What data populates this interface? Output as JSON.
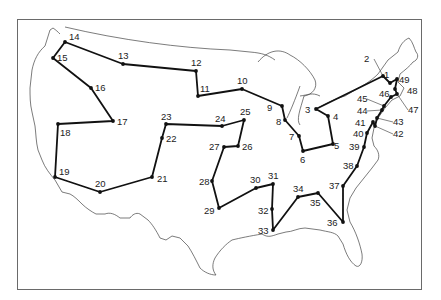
{
  "map": {
    "title": "Traveling salesman tour of 49 US cities",
    "frame": {
      "x": 17,
      "y": 19,
      "width": 404,
      "height": 270
    },
    "route_color": "#111111",
    "outline_color": "#444444",
    "stops": [
      {
        "n": "1",
        "x": 390,
        "y": 83,
        "lx": 384,
        "ly": 78
      },
      {
        "n": "2",
        "x": 383,
        "y": 76,
        "lx": 364,
        "ly": 62,
        "leader": true
      },
      {
        "n": "3",
        "x": 316,
        "y": 109,
        "lx": 305,
        "ly": 113
      },
      {
        "n": "4",
        "x": 328,
        "y": 116,
        "lx": 333,
        "ly": 120
      },
      {
        "n": "5",
        "x": 333,
        "y": 144,
        "lx": 334,
        "ly": 149
      },
      {
        "n": "6",
        "x": 303,
        "y": 151,
        "lx": 300,
        "ly": 163
      },
      {
        "n": "7",
        "x": 299,
        "y": 136,
        "lx": 289,
        "ly": 140
      },
      {
        "n": "8",
        "x": 285,
        "y": 120,
        "lx": 276,
        "ly": 125
      },
      {
        "n": "9",
        "x": 282,
        "y": 106,
        "lx": 267,
        "ly": 111
      },
      {
        "n": "10",
        "x": 242,
        "y": 89,
        "lx": 237,
        "ly": 84
      },
      {
        "n": "11",
        "x": 198,
        "y": 96,
        "lx": 200,
        "ly": 92
      },
      {
        "n": "12",
        "x": 196,
        "y": 71,
        "lx": 191,
        "ly": 66
      },
      {
        "n": "13",
        "x": 123,
        "y": 64,
        "lx": 118,
        "ly": 59
      },
      {
        "n": "14",
        "x": 65,
        "y": 42,
        "lx": 69,
        "ly": 40
      },
      {
        "n": "15",
        "x": 53,
        "y": 58,
        "lx": 57,
        "ly": 61
      },
      {
        "n": "16",
        "x": 91,
        "y": 88,
        "lx": 95,
        "ly": 91
      },
      {
        "n": "17",
        "x": 113,
        "y": 121,
        "lx": 117,
        "ly": 125
      },
      {
        "n": "18",
        "x": 58,
        "y": 124,
        "lx": 60,
        "ly": 136
      },
      {
        "n": "19",
        "x": 55,
        "y": 177,
        "lx": 59,
        "ly": 175
      },
      {
        "n": "20",
        "x": 100,
        "y": 192,
        "lx": 95,
        "ly": 187
      },
      {
        "n": "21",
        "x": 152,
        "y": 177,
        "lx": 157,
        "ly": 182
      },
      {
        "n": "22",
        "x": 162,
        "y": 138,
        "lx": 166,
        "ly": 142
      },
      {
        "n": "23",
        "x": 166,
        "y": 124,
        "lx": 161,
        "ly": 120
      },
      {
        "n": "24",
        "x": 222,
        "y": 126,
        "lx": 215,
        "ly": 122
      },
      {
        "n": "25",
        "x": 244,
        "y": 120,
        "lx": 240,
        "ly": 115
      },
      {
        "n": "26",
        "x": 238,
        "y": 146,
        "lx": 242,
        "ly": 150
      },
      {
        "n": "27",
        "x": 224,
        "y": 147,
        "lx": 209,
        "ly": 150
      },
      {
        "n": "28",
        "x": 212,
        "y": 181,
        "lx": 199,
        "ly": 185
      },
      {
        "n": "29",
        "x": 219,
        "y": 208,
        "lx": 204,
        "ly": 214
      },
      {
        "n": "30",
        "x": 256,
        "y": 188,
        "lx": 250,
        "ly": 183
      },
      {
        "n": "31",
        "x": 273,
        "y": 184,
        "lx": 268,
        "ly": 179
      },
      {
        "n": "32",
        "x": 272,
        "y": 209,
        "lx": 258,
        "ly": 214
      },
      {
        "n": "33",
        "x": 273,
        "y": 230,
        "lx": 258,
        "ly": 234
      },
      {
        "n": "34",
        "x": 298,
        "y": 197,
        "lx": 293,
        "ly": 192
      },
      {
        "n": "35",
        "x": 318,
        "y": 193,
        "lx": 310,
        "ly": 206
      },
      {
        "n": "36",
        "x": 343,
        "y": 222,
        "lx": 327,
        "ly": 226
      },
      {
        "n": "37",
        "x": 343,
        "y": 186,
        "lx": 329,
        "ly": 189
      },
      {
        "n": "38",
        "x": 357,
        "y": 166,
        "lx": 343,
        "ly": 169
      },
      {
        "n": "39",
        "x": 364,
        "y": 147,
        "lx": 349,
        "ly": 150
      },
      {
        "n": "40",
        "x": 367,
        "y": 133,
        "lx": 353,
        "ly": 137
      },
      {
        "n": "41",
        "x": 373,
        "y": 122,
        "lx": 355,
        "ly": 126
      },
      {
        "n": "42",
        "x": 375,
        "y": 126,
        "lx": 393,
        "ly": 137,
        "leader": true
      },
      {
        "n": "43",
        "x": 377,
        "y": 118,
        "lx": 393,
        "ly": 125,
        "leader": true
      },
      {
        "n": "44",
        "x": 382,
        "y": 110,
        "lx": 357,
        "ly": 114,
        "leader": true
      },
      {
        "n": "45",
        "x": 384,
        "y": 106,
        "lx": 357,
        "ly": 102,
        "leader": true
      },
      {
        "n": "46",
        "x": 391,
        "y": 97,
        "lx": 379,
        "ly": 97
      },
      {
        "n": "47",
        "x": 397,
        "y": 94,
        "lx": 408,
        "ly": 113,
        "leader": true
      },
      {
        "n": "48",
        "x": 395,
        "y": 89,
        "lx": 407,
        "ly": 94
      },
      {
        "n": "49",
        "x": 397,
        "y": 79,
        "lx": 399,
        "ly": 83
      }
    ],
    "tour_order": [
      "14",
      "13",
      "12",
      "11",
      "10",
      "9",
      "8",
      "7",
      "6",
      "5",
      "4",
      "3",
      "2",
      "1",
      "49",
      "48",
      "47",
      "46",
      "45",
      "44",
      "43",
      "42",
      "41",
      "40",
      "39",
      "38",
      "37",
      "36",
      "35",
      "34",
      "33",
      "32",
      "31",
      "30",
      "29",
      "28",
      "27",
      "26",
      "25",
      "24",
      "23",
      "22",
      "21",
      "20",
      "19",
      "18",
      "17",
      "16",
      "15",
      "14"
    ]
  }
}
